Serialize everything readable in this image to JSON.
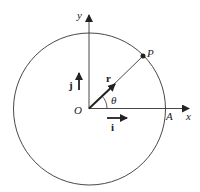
{
  "diagram": {
    "title": "",
    "labels": {
      "y_axis": "y",
      "x_axis": "x",
      "origin": "O",
      "point_p": "P",
      "point_a": "A",
      "angle": "θ",
      "unit_i": "i",
      "unit_j": "j",
      "position_vector": "r"
    },
    "colors": {
      "stroke": "#333333",
      "background": "#ffffff"
    }
  }
}
